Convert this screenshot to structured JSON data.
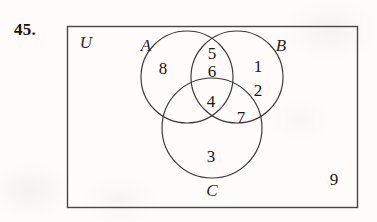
{
  "exercise": {
    "number": "45."
  },
  "diagram": {
    "type": "venn-3-set",
    "universe_label": "U",
    "sets": [
      {
        "key": "A",
        "label": "A"
      },
      {
        "key": "B",
        "label": "B"
      },
      {
        "key": "C",
        "label": "C"
      }
    ],
    "regions": [
      {
        "key": "A_only",
        "label": "A only",
        "value": "8"
      },
      {
        "key": "AB_top",
        "label": "A and B",
        "value": "5"
      },
      {
        "key": "AB_bottom",
        "label": "A and B",
        "value": "6"
      },
      {
        "key": "B_only_1",
        "label": "B only",
        "value": "1"
      },
      {
        "key": "B_only_2",
        "label": "B only",
        "value": "2"
      },
      {
        "key": "ABC",
        "label": "A and B and C",
        "value": "4"
      },
      {
        "key": "BC",
        "label": "B and C",
        "value": "7"
      },
      {
        "key": "C_only",
        "label": "C only",
        "value": "3"
      },
      {
        "key": "outside",
        "label": "outside all sets",
        "value": "9"
      }
    ],
    "colors": {
      "circle_stroke": "#3a3734",
      "rect_stroke": "#494643",
      "text": "#181512",
      "paper": "#fdfcfa"
    }
  }
}
